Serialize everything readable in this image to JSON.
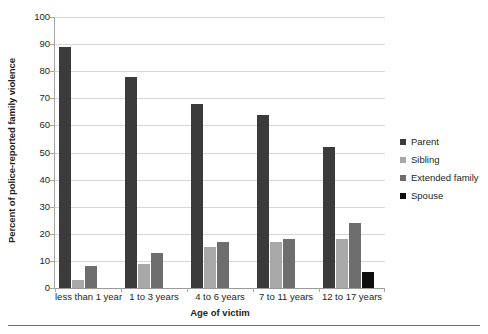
{
  "chart_data": {
    "type": "bar",
    "title": "",
    "subtitle": "",
    "xlabel": "Age of victim",
    "ylabel": "Percent of police-reported family violence",
    "categories": [
      "less than 1 year",
      "1 to 3 years",
      "4 to 6 years",
      "7 to 11 years",
      "12 to 17 years"
    ],
    "series": [
      {
        "name": "Parent",
        "values": [
          89,
          78,
          68,
          64,
          52
        ],
        "color": "#3b3b3b"
      },
      {
        "name": "Sibling",
        "values": [
          3,
          9,
          15,
          17,
          18
        ],
        "color": "#a8a8a8"
      },
      {
        "name": "Extended family",
        "values": [
          8,
          13,
          17,
          18,
          24
        ],
        "color": "#6e6e6e"
      },
      {
        "name": "Spouse",
        "values": [
          0,
          0,
          0,
          0,
          6
        ],
        "color": "#0d0d0d"
      }
    ],
    "ylim": [
      0,
      100
    ],
    "yticks": [
      0,
      10,
      20,
      30,
      40,
      50,
      60,
      70,
      80,
      90,
      100
    ],
    "ytick_labels": [
      "0",
      "10",
      "20",
      "30",
      "40",
      "50",
      "60",
      "70",
      "80",
      "90",
      "100"
    ],
    "grid": true,
    "grid_axis": "y",
    "grid_color": "#d6d6d6",
    "legend_position": "right",
    "legend_entries": [
      "Parent",
      "Sibling",
      "Extended family",
      "Spouse"
    ],
    "axis_color": "#a6a6a6",
    "background": "#ffffff"
  }
}
